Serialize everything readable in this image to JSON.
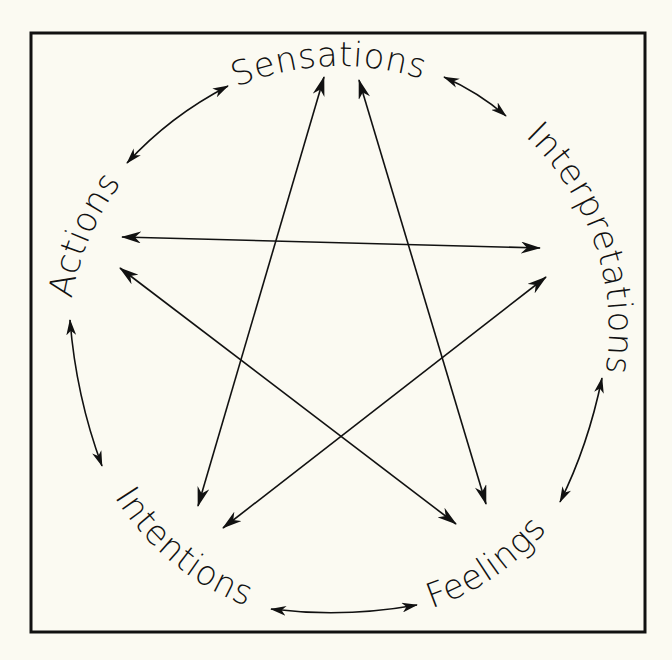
{
  "diagram": {
    "type": "cycle-with-star",
    "background_color": "#fbfaf2",
    "line_color": "#111111",
    "nodes": [
      {
        "id": "sensations",
        "label": "Sensations"
      },
      {
        "id": "interpretations",
        "label": "Interpretations"
      },
      {
        "id": "feelings",
        "label": "Feelings"
      },
      {
        "id": "intentions",
        "label": "Intentions"
      },
      {
        "id": "actions",
        "label": "Actions"
      }
    ],
    "perimeter_edges": [
      {
        "from": "sensations",
        "to": "interpretations",
        "bidirectional": true
      },
      {
        "from": "interpretations",
        "to": "feelings",
        "bidirectional": true
      },
      {
        "from": "feelings",
        "to": "intentions",
        "bidirectional": true
      },
      {
        "from": "intentions",
        "to": "actions",
        "bidirectional": true
      },
      {
        "from": "actions",
        "to": "sensations",
        "bidirectional": true
      }
    ],
    "star_edges": [
      {
        "from": "actions",
        "to": "interpretations",
        "bidirectional": true
      },
      {
        "from": "actions",
        "to": "feelings",
        "bidirectional": true
      },
      {
        "from": "sensations",
        "to": "intentions",
        "bidirectional": true
      },
      {
        "from": "sensations",
        "to": "feelings",
        "bidirectional": true
      },
      {
        "from": "interpretations",
        "to": "intentions",
        "bidirectional": true
      }
    ]
  }
}
